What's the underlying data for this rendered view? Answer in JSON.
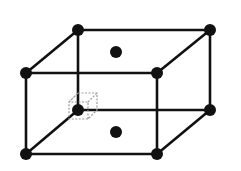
{
  "diagram": {
    "type": "crystal-lattice-unit-cell",
    "colors": {
      "edge": "#111111",
      "atom": "#111111",
      "highlight": "#999999",
      "background": "#ffffff"
    },
    "atoms": {
      "corners": [
        "back-top-left",
        "back-top-right",
        "front-top-left",
        "front-top-right",
        "back-bottom-left",
        "back-bottom-right",
        "front-bottom-left",
        "front-bottom-right"
      ],
      "face_centers": [
        "top",
        "bottom"
      ]
    },
    "highlight": "dotted-cube-at-back-bottom-left-corner"
  }
}
